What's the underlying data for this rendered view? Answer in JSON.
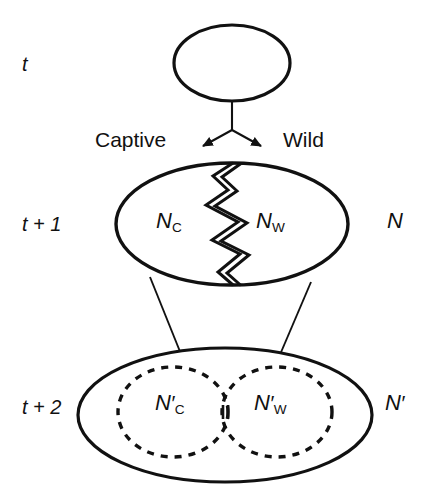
{
  "figure": {
    "width": 434,
    "height": 498,
    "background": "#ffffff",
    "stroke_color": "#111111"
  },
  "time_labels": {
    "t0": "t",
    "t1": "t + 1",
    "t2": "t + 2"
  },
  "branch_labels": {
    "left": "Captive",
    "right": "Wild"
  },
  "generation_t1": {
    "captive_symbol": "N",
    "captive_subscript": "C",
    "wild_symbol": "N",
    "wild_subscript": "W",
    "total_symbol": "N"
  },
  "generation_t2": {
    "captive_symbol": "N",
    "captive_prime": "′",
    "captive_subscript": "C",
    "wild_symbol": "N",
    "wild_prime": "′",
    "wild_subscript": "W",
    "total_symbol": "N",
    "total_prime": "′"
  },
  "shapes": {
    "top_ellipse": {
      "cx": 232,
      "cy": 63,
      "rx": 58,
      "ry": 38,
      "style": "solid"
    },
    "middle_ellipse": {
      "cx": 232,
      "cy": 224,
      "rx": 116,
      "ry": 61,
      "style": "solid",
      "divider": "jagged-crack"
    },
    "bottom_ellipse": {
      "cx": 225,
      "cy": 415,
      "rx": 147,
      "ry": 67,
      "style": "solid"
    },
    "bottom_left_dashed": {
      "cx": 173,
      "cy": 412,
      "rx": 55,
      "ry": 45,
      "style": "dashed"
    },
    "bottom_right_dashed": {
      "cx": 277,
      "cy": 412,
      "rx": 55,
      "ry": 45,
      "style": "dashed"
    },
    "overlap_marker": "narrow-lens"
  },
  "connectors": {
    "fork_stem": {
      "x": 232,
      "y1": 103,
      "y2": 130
    },
    "fork_left_arrow": {
      "x1": 232,
      "y1": 130,
      "x2": 201,
      "y2": 147
    },
    "fork_right_arrow": {
      "x1": 232,
      "y1": 130,
      "x2": 263,
      "y2": 147
    },
    "descent_left_arrow": {
      "x1": 150,
      "y1": 277,
      "x2": 186,
      "y2": 367
    },
    "descent_right_arrow": {
      "x1": 311,
      "y1": 282,
      "x2": 275,
      "y2": 367
    }
  }
}
